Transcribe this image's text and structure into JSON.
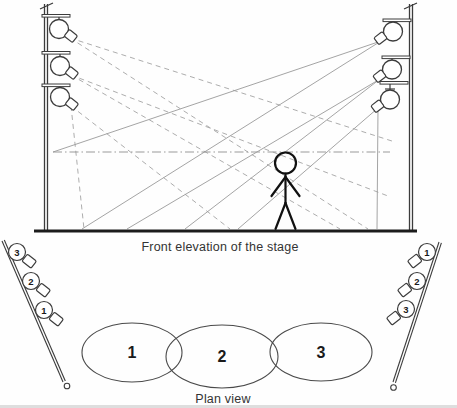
{
  "diagram": {
    "elevation": {
      "caption": "Front elevation of the stage"
    },
    "plan": {
      "caption": "Plan view",
      "areas": [
        {
          "label": "1"
        },
        {
          "label": "2"
        },
        {
          "label": "3"
        }
      ],
      "left_boom_lights": [
        {
          "label": "3"
        },
        {
          "label": "2"
        },
        {
          "label": "1"
        }
      ],
      "right_boom_lights": [
        {
          "label": "1"
        },
        {
          "label": "2"
        },
        {
          "label": "3"
        }
      ]
    },
    "icons": {
      "spotlight-icon": "outlined circle lamp with angled nozzle",
      "caster-icon": "small outlined circle at boom base"
    },
    "colors": {
      "structure_line": "#3c3c3c",
      "beam_dashed": "#adadad",
      "beam_solid": "#9a9a9a",
      "head_height_line": "#999999",
      "figure": "#111111",
      "text": "#333333",
      "background": "#fefefe"
    }
  }
}
